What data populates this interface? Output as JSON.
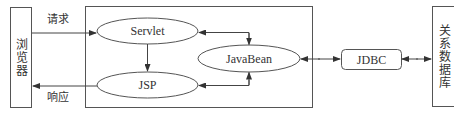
{
  "diagram": {
    "nodes": {
      "browser": {
        "label": "浏览器"
      },
      "servlet": {
        "label": "Servlet"
      },
      "jsp": {
        "label": "JSP"
      },
      "javabean": {
        "label": "JavaBean"
      },
      "jdbc": {
        "label": "JDBC"
      },
      "database": {
        "label": "关系数据库"
      }
    },
    "edges": {
      "request": {
        "label": "请求"
      },
      "response": {
        "label": "响应"
      }
    },
    "colors": {
      "stroke": "#555555",
      "text": "#333333",
      "background": "#ffffff"
    }
  }
}
